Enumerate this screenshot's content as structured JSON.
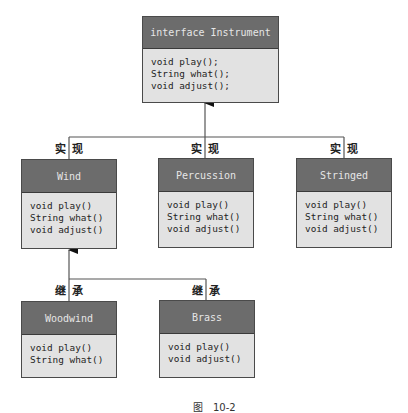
{
  "diagram": {
    "type": "uml-class-diagram",
    "colors": {
      "header_bg": "#6c6c6c",
      "header_text": "#e6e6e6",
      "body_bg": "#e2e2e2",
      "border": "#4a4a4a",
      "line": "#555555"
    },
    "interface": {
      "title": "interface Instrument",
      "methods": [
        "void play();",
        "String what();",
        "void adjust();"
      ]
    },
    "classes": {
      "wind": {
        "title": "Wind",
        "methods": [
          "void play()",
          "String what()",
          "void adjust()"
        ],
        "relation_label": [
          "实",
          "现"
        ]
      },
      "percussion": {
        "title": "Percussion",
        "methods": [
          "void play()",
          "String what()",
          "void adjust()"
        ],
        "relation_label": [
          "实",
          "现"
        ]
      },
      "stringed": {
        "title": "Stringed",
        "methods": [
          "void play()",
          "String what()",
          "void adjust()"
        ],
        "relation_label": [
          "实",
          "现"
        ]
      },
      "woodwind": {
        "title": "Woodwind",
        "methods": [
          "void play()",
          "String what()"
        ],
        "relation_label": [
          "继",
          "承"
        ]
      },
      "brass": {
        "title": "Brass",
        "methods": [
          "void play()",
          "void adjust()"
        ],
        "relation_label": [
          "继",
          "承"
        ]
      }
    },
    "caption": {
      "prefix": "图",
      "number": "10-2"
    }
  }
}
